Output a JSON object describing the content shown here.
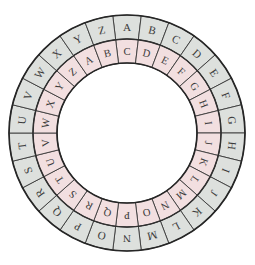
{
  "figure": {
    "name": "cipher-wheel",
    "type": "caesar-cipher-disk",
    "background_color": "#ffffff"
  },
  "geometry": {
    "center_x": 127,
    "center_y": 133,
    "outer_radius": 118,
    "middle_radius": 94,
    "inner_radius": 70,
    "sectors": 26,
    "sector_degrees": 13.846,
    "letter_orientation": "radial"
  },
  "colors": {
    "outer_ring_fill": "#dde0dd",
    "inner_ring_fill": "#f2dfe0",
    "outline": "#262626",
    "separator": "#3a3a3a",
    "letter": "#3b3b3b",
    "hub": "#ffffff"
  },
  "outer_ring": {
    "name": "outer-alphabet-ring",
    "start_letter": "A",
    "start_angle_deg": 0,
    "direction": "clockwise",
    "letters": [
      "A",
      "B",
      "C",
      "D",
      "E",
      "F",
      "G",
      "H",
      "I",
      "J",
      "K",
      "L",
      "M",
      "N",
      "O",
      "P",
      "Q",
      "R",
      "S",
      "T",
      "U",
      "V",
      "W",
      "X",
      "Y",
      "Z"
    ]
  },
  "inner_ring": {
    "name": "inner-alphabet-ring",
    "start_letter": "C",
    "shift": 2,
    "start_angle_deg": 0,
    "direction": "clockwise",
    "letters": [
      "C",
      "D",
      "E",
      "F",
      "G",
      "H",
      "I",
      "J",
      "K",
      "L",
      "M",
      "N",
      "O",
      "P",
      "Q",
      "R",
      "S",
      "T",
      "U",
      "V",
      "W",
      "X",
      "Y",
      "Z",
      "A",
      "B"
    ]
  },
  "alignment": {
    "top_outer": "A",
    "top_inner": "C",
    "pairs": [
      [
        "A",
        "C"
      ],
      [
        "B",
        "D"
      ],
      [
        "C",
        "E"
      ],
      [
        "D",
        "F"
      ],
      [
        "E",
        "G"
      ],
      [
        "F",
        "H"
      ],
      [
        "G",
        "I"
      ],
      [
        "H",
        "J"
      ],
      [
        "I",
        "K"
      ],
      [
        "J",
        "L"
      ],
      [
        "K",
        "M"
      ],
      [
        "L",
        "N"
      ],
      [
        "M",
        "O"
      ],
      [
        "N",
        "P"
      ],
      [
        "O",
        "Q"
      ],
      [
        "P",
        "R"
      ],
      [
        "Q",
        "S"
      ],
      [
        "R",
        "T"
      ],
      [
        "S",
        "U"
      ],
      [
        "T",
        "V"
      ],
      [
        "U",
        "W"
      ],
      [
        "V",
        "X"
      ],
      [
        "W",
        "Y"
      ],
      [
        "X",
        "Z"
      ],
      [
        "Y",
        "A"
      ],
      [
        "Z",
        "B"
      ]
    ]
  }
}
